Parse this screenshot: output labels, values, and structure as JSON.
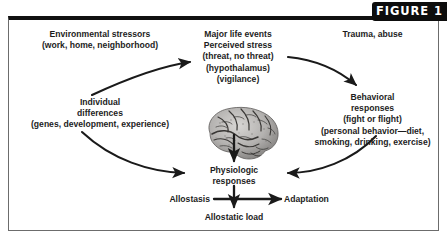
{
  "figure": {
    "badge_label": "FIGURE 1"
  },
  "blocks": {
    "environmental_stressors": {
      "lines": [
        "Environmental stressors",
        "(work, home, neighborhood)"
      ]
    },
    "major_life_events": {
      "lines": [
        "Major life events",
        "Perceived stress",
        "(threat, no threat)",
        "(hypothalamus)",
        "(vigilance)"
      ]
    },
    "trauma_abuse": {
      "lines": [
        "Trauma, abuse"
      ]
    },
    "individual_differences": {
      "lines": [
        "Individual",
        "differences",
        "(genes, development, experience)"
      ]
    },
    "behavioral_responses": {
      "lines": [
        "Behavioral",
        "responses",
        "(fight or flight)",
        "(personal behavior—diet,",
        "smoking, drinking, exercise)"
      ]
    },
    "physiologic_responses": {
      "lines": [
        "Physiologic",
        "responses"
      ]
    },
    "allostasis": {
      "lines": [
        "Allostasis"
      ]
    },
    "adaptation": {
      "lines": [
        "Adaptation"
      ]
    },
    "allostatic_load": {
      "lines": [
        "Allostatic load"
      ]
    }
  },
  "graphics": {
    "brain_label": "brain-illustration",
    "arrows": [
      "individual-differences-to-perceived-stress",
      "perceived-stress-to-behavioral-responses",
      "brain-to-physiologic-responses",
      "individual-differences-to-physiologic-responses",
      "behavioral-responses-to-physiologic-responses",
      "physiologic-responses-to-allostatic-load",
      "allostasis-to-adaptation"
    ]
  },
  "colors": {
    "badge_bg": "#0d0d0d",
    "badge_text": "#ffffff",
    "frame_top": "#111111",
    "frame_side": "#6c6c6c",
    "text": "#1d1d1d",
    "arrow": "#1a1a1a",
    "page_bg": "#ffffff"
  }
}
